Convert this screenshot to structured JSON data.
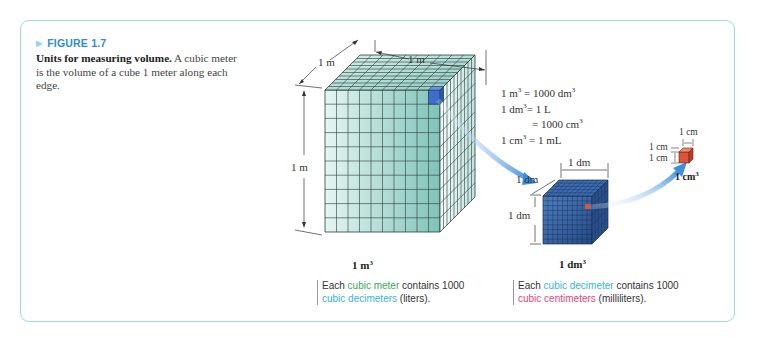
{
  "figure": {
    "label": "FIGURE 1.7",
    "caption_bold": "Units for measuring volume.",
    "caption_rest": " A cubic meter is the volume of a cube 1 meter along each edge."
  },
  "equations": [
    {
      "lhs": "1 m",
      "lhs_exp": "3",
      "rhs": " = 1000 dm",
      "rhs_exp": "3"
    },
    {
      "lhs": "1 dm",
      "lhs_exp": "3",
      "rhs": "= 1 L",
      "rhs_exp": ""
    },
    {
      "lhs": "",
      "lhs_exp": "",
      "rhs": "= 1000 cm",
      "rhs_exp": "3"
    },
    {
      "lhs": "1 cm",
      "lhs_exp": "3",
      "rhs": " = 1 mL",
      "rhs_exp": ""
    }
  ],
  "cubes": {
    "meter": {
      "edge_label": "1 m",
      "volume_label": "1 m",
      "volume_exp": "3",
      "color": "#7cc4b8"
    },
    "decimeter": {
      "edge_label": "1 dm",
      "volume_label": "1 dm",
      "volume_exp": "3",
      "color": "#2e5a9a"
    },
    "centimeter": {
      "edge_label": "1 cm",
      "volume_label": "1 cm",
      "volume_exp": "3",
      "color": "#e0533a"
    }
  },
  "notes": {
    "meter": {
      "pre": "Each ",
      "highlight1": "cubic meter",
      "mid": " contains 1000",
      "highlight2": "cubic decimeters",
      "post": " (liters)."
    },
    "decimeter": {
      "pre": "Each ",
      "highlight1": "cubic decimeter",
      "mid": " contains 1000",
      "highlight2": "cubic centimeters",
      "post": " (milliliters)."
    }
  },
  "colors": {
    "frame": "#9fd9e2",
    "figure_label": "#2b8fcf",
    "green": "#3aa956",
    "cyan": "#38b3d8",
    "pink": "#e2457a",
    "arrow": "#3d8fe0"
  }
}
